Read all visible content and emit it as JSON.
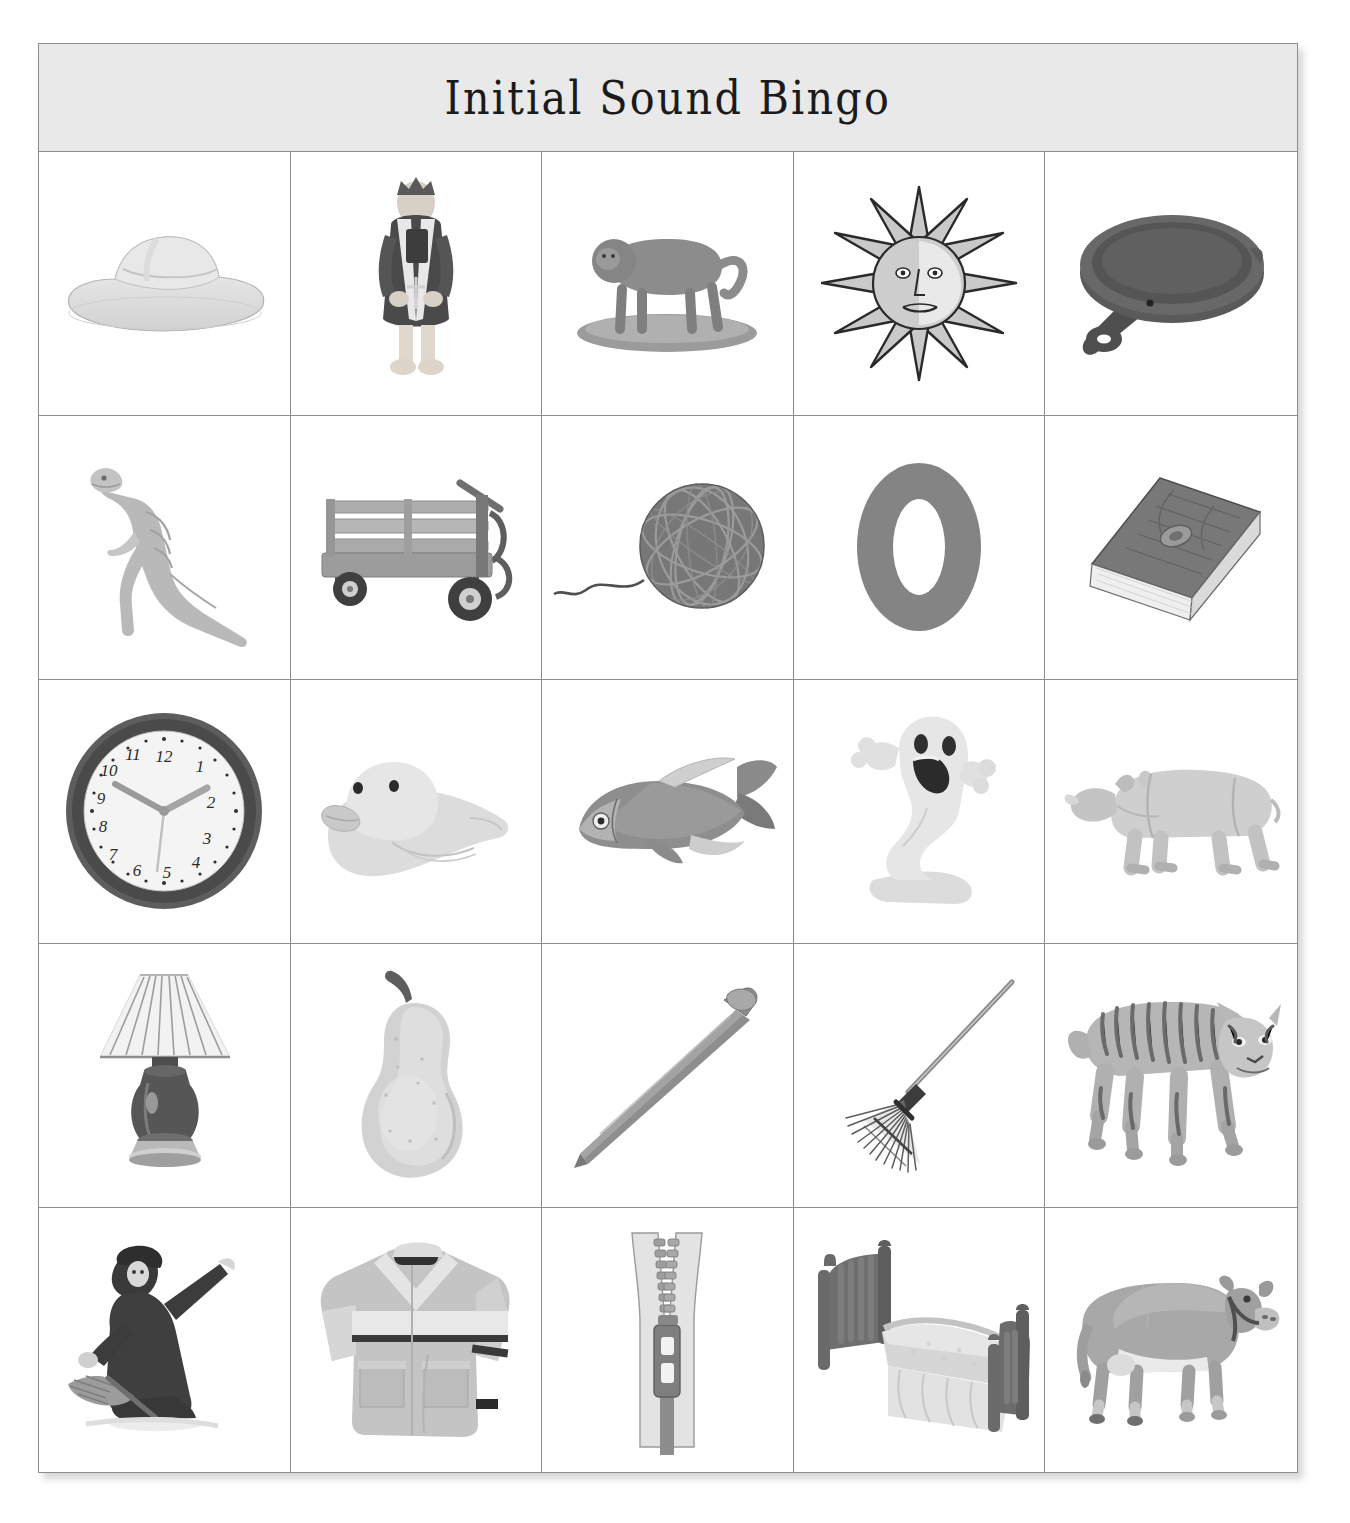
{
  "card": {
    "title": "Initial Sound Bingo",
    "rows": 5,
    "columns": 5,
    "border_color": "#8d8d8d",
    "title_band_color": "#e9e9e9",
    "page_background": "#ffffff"
  },
  "cells": [
    {
      "row": 1,
      "col": 1,
      "icon": "cowboy-hat-icon",
      "label": "hat"
    },
    {
      "row": 1,
      "col": 2,
      "icon": "king-icon",
      "label": "king"
    },
    {
      "row": 1,
      "col": 3,
      "icon": "baboon-icon",
      "label": "baboon"
    },
    {
      "row": 1,
      "col": 4,
      "icon": "sun-icon",
      "label": "sun"
    },
    {
      "row": 1,
      "col": 5,
      "icon": "frying-pan-icon",
      "label": "pan"
    },
    {
      "row": 2,
      "col": 1,
      "icon": "dinosaur-icon",
      "label": "dinosaur"
    },
    {
      "row": 2,
      "col": 2,
      "icon": "wagon-icon",
      "label": "wagon"
    },
    {
      "row": 2,
      "col": 3,
      "icon": "yarn-ball-icon",
      "label": "yarn"
    },
    {
      "row": 2,
      "col": 4,
      "icon": "letter-o-icon",
      "label": "O"
    },
    {
      "row": 2,
      "col": 5,
      "icon": "book-icon",
      "label": "book"
    },
    {
      "row": 3,
      "col": 1,
      "icon": "clock-icon",
      "label": "clock"
    },
    {
      "row": 3,
      "col": 2,
      "icon": "duck-icon",
      "label": "duck"
    },
    {
      "row": 3,
      "col": 3,
      "icon": "fish-icon",
      "label": "fish"
    },
    {
      "row": 3,
      "col": 4,
      "icon": "ghost-icon",
      "label": "ghost"
    },
    {
      "row": 3,
      "col": 5,
      "icon": "rhinoceros-icon",
      "label": "rhinoceros"
    },
    {
      "row": 4,
      "col": 1,
      "icon": "lamp-icon",
      "label": "lamp"
    },
    {
      "row": 4,
      "col": 2,
      "icon": "pear-icon",
      "label": "pear"
    },
    {
      "row": 4,
      "col": 3,
      "icon": "nail-icon",
      "label": "nail"
    },
    {
      "row": 4,
      "col": 4,
      "icon": "rake-icon",
      "label": "rake"
    },
    {
      "row": 4,
      "col": 5,
      "icon": "tiger-icon",
      "label": "tiger"
    },
    {
      "row": 5,
      "col": 1,
      "icon": "witch-icon",
      "label": "witch"
    },
    {
      "row": 5,
      "col": 2,
      "icon": "jacket-icon",
      "label": "jacket"
    },
    {
      "row": 5,
      "col": 3,
      "icon": "zipper-icon",
      "label": "zipper"
    },
    {
      "row": 5,
      "col": 4,
      "icon": "bed-icon",
      "label": "bed"
    },
    {
      "row": 5,
      "col": 5,
      "icon": "cow-icon",
      "label": "cow"
    }
  ],
  "clock_face": {
    "numerals": [
      "12",
      "1",
      "2",
      "3",
      "4",
      "5",
      "6",
      "7",
      "8",
      "9",
      "10",
      "11"
    ],
    "hour_hand_points_to": "2",
    "minute_hand_points_to": "10",
    "second_hand_points_to": "6"
  },
  "letter_tile": {
    "character": "O",
    "color": "#808080"
  }
}
